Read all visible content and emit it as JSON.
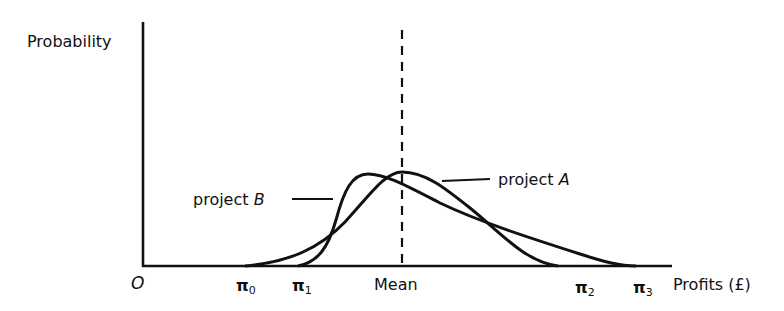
{
  "diagram": {
    "type": "probability-distribution-comparison",
    "y_axis_label": "Probability",
    "x_axis_label": "Profits (£)",
    "origin_label": "O",
    "mean_label": "Mean",
    "x_ticks": [
      {
        "symbol": "π",
        "sub": "0"
      },
      {
        "symbol": "π",
        "sub": "1"
      },
      {
        "symbol": "π",
        "sub": "2"
      },
      {
        "symbol": "π",
        "sub": "3"
      }
    ],
    "curves": [
      {
        "name": "project A",
        "prefix": "project ",
        "letter": "A",
        "range": "π0 to π2",
        "peak": "at mean"
      },
      {
        "name": "project B",
        "prefix": "project ",
        "letter": "B",
        "range": "π1 to π3",
        "peak": "left of mean, long right tail"
      }
    ],
    "colors": {
      "ink": "#111111",
      "background": "#ffffff"
    }
  }
}
